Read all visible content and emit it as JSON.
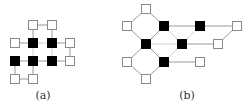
{
  "colors": {
    "filled": "#000000",
    "empty_fill": "#ffffff",
    "empty_stroke": "#8a8a8a",
    "edge": "#9a9a9a",
    "edge_light": "#cfcfcf"
  },
  "node_size": 10,
  "diagrams": [
    {
      "id": "a",
      "label": "(a)",
      "label_pos": [
        43,
        97
      ],
      "nodes": [
        {
          "id": "a1",
          "x": 33,
          "y": 25,
          "filled": false
        },
        {
          "id": "a2",
          "x": 52,
          "y": 25,
          "filled": false
        },
        {
          "id": "a3",
          "x": 15,
          "y": 43,
          "filled": false
        },
        {
          "id": "a4",
          "x": 33,
          "y": 43,
          "filled": true
        },
        {
          "id": "a5",
          "x": 52,
          "y": 43,
          "filled": true
        },
        {
          "id": "a6",
          "x": 70,
          "y": 43,
          "filled": false
        },
        {
          "id": "a7",
          "x": 15,
          "y": 61,
          "filled": true
        },
        {
          "id": "a8",
          "x": 33,
          "y": 61,
          "filled": true
        },
        {
          "id": "a9",
          "x": 52,
          "y": 61,
          "filled": true
        },
        {
          "id": "a10",
          "x": 70,
          "y": 61,
          "filled": false
        },
        {
          "id": "a11",
          "x": 15,
          "y": 79,
          "filled": false
        },
        {
          "id": "a12",
          "x": 33,
          "y": 79,
          "filled": false
        }
      ],
      "edges": [
        [
          "a1",
          "a2",
          "dark"
        ],
        [
          "a1",
          "a4",
          "dark"
        ],
        [
          "a2",
          "a5",
          "dark"
        ],
        [
          "a3",
          "a4",
          "dark"
        ],
        [
          "a4",
          "a5",
          "light"
        ],
        [
          "a5",
          "a6",
          "dark"
        ],
        [
          "a4",
          "a8",
          "light"
        ],
        [
          "a5",
          "a9",
          "light"
        ],
        [
          "a6",
          "a10",
          "dark"
        ],
        [
          "a7",
          "a8",
          "dark"
        ],
        [
          "a8",
          "a9",
          "dark"
        ],
        [
          "a9",
          "a10",
          "dark"
        ],
        [
          "a7",
          "a11",
          "dark"
        ],
        [
          "a8",
          "a12",
          "dark"
        ],
        [
          "a11",
          "a12",
          "dark"
        ]
      ]
    },
    {
      "id": "b",
      "label": "(b)",
      "label_pos": [
        187,
        97
      ],
      "nodes": [
        {
          "id": "b1",
          "x": 146,
          "y": 9,
          "filled": false
        },
        {
          "id": "b2",
          "x": 127,
          "y": 26,
          "filled": false
        },
        {
          "id": "b3",
          "x": 164,
          "y": 26,
          "filled": true
        },
        {
          "id": "b4",
          "x": 200,
          "y": 26,
          "filled": true
        },
        {
          "id": "b5",
          "x": 237,
          "y": 26,
          "filled": false
        },
        {
          "id": "b6",
          "x": 146,
          "y": 44,
          "filled": true
        },
        {
          "id": "b7",
          "x": 182,
          "y": 44,
          "filled": true
        },
        {
          "id": "b8",
          "x": 218,
          "y": 44,
          "filled": false
        },
        {
          "id": "b9",
          "x": 127,
          "y": 62,
          "filled": false
        },
        {
          "id": "b10",
          "x": 164,
          "y": 62,
          "filled": true
        },
        {
          "id": "b11",
          "x": 200,
          "y": 62,
          "filled": false
        },
        {
          "id": "b12",
          "x": 146,
          "y": 79,
          "filled": false
        }
      ],
      "edges": [
        [
          "b1",
          "b2",
          "dark"
        ],
        [
          "b1",
          "b3",
          "dark"
        ],
        [
          "b2",
          "b6",
          "dark"
        ],
        [
          "b3",
          "b6",
          "dark"
        ],
        [
          "b3",
          "b7",
          "light"
        ],
        [
          "b3",
          "b4",
          "dark"
        ],
        [
          "b4",
          "b5",
          "dark"
        ],
        [
          "b5",
          "b8",
          "dark"
        ],
        [
          "b4",
          "b7",
          "light"
        ],
        [
          "b6",
          "b7",
          "light"
        ],
        [
          "b7",
          "b8",
          "dark"
        ],
        [
          "b6",
          "b9",
          "dark"
        ],
        [
          "b6",
          "b10",
          "dark"
        ],
        [
          "b7",
          "b10",
          "light"
        ],
        [
          "b10",
          "b11",
          "dark"
        ],
        [
          "b9",
          "b12",
          "dark"
        ],
        [
          "b10",
          "b12",
          "dark"
        ]
      ]
    }
  ]
}
